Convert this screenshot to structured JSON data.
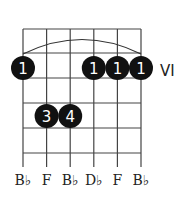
{
  "chord": {
    "position_label": "VI",
    "string_notes": [
      "B♭",
      "F",
      "B♭",
      "D♭",
      "F",
      "B♭"
    ],
    "barre": {
      "finger": "1",
      "from_string": 1,
      "to_string": 6,
      "fret": 1
    },
    "fingers": [
      {
        "string": 1,
        "fret": 1,
        "label": "1"
      },
      {
        "string": 4,
        "fret": 1,
        "label": "1"
      },
      {
        "string": 5,
        "fret": 1,
        "label": "1"
      },
      {
        "string": 6,
        "fret": 1,
        "label": "1"
      },
      {
        "string": 2,
        "fret": 3,
        "label": "3"
      },
      {
        "string": 3,
        "fret": 3,
        "label": "4"
      }
    ]
  },
  "colors": {
    "grid": "#333333",
    "dot": "#111111",
    "dot_text": "#ffffff"
  }
}
